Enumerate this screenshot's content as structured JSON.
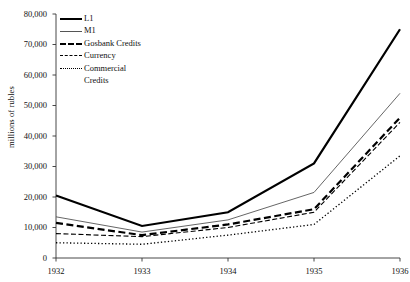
{
  "chart_data": {
    "type": "line",
    "title": "",
    "xlabel": "",
    "ylabel": "millions of rubles",
    "categories": [
      "1932",
      "1933",
      "1934",
      "1935",
      "1936"
    ],
    "x": [
      1932,
      1933,
      1934,
      1935,
      1936
    ],
    "xlim": [
      1932,
      1936
    ],
    "ylim": [
      0,
      80000
    ],
    "yticks": [
      0,
      10000,
      20000,
      30000,
      40000,
      50000,
      60000,
      70000,
      80000
    ],
    "ytick_labels": [
      "0",
      "10,000",
      "20,000",
      "30,000",
      "40,000",
      "50,000",
      "60,000",
      "70,000",
      "80,000"
    ],
    "xtick_labels": [
      "1932",
      "1933",
      "1934",
      "1935",
      "1936"
    ],
    "grid": false,
    "legend_position": "top-left",
    "series": [
      {
        "name": "L1",
        "style": "solid-thick",
        "values": [
          20500,
          10500,
          15000,
          31000,
          75000
        ]
      },
      {
        "name": "M1",
        "style": "solid-thin",
        "values": [
          13500,
          8500,
          12500,
          21500,
          54000
        ]
      },
      {
        "name": "Gosbank Credits",
        "style": "long-dash",
        "values": [
          11500,
          7500,
          11000,
          16000,
          46000
        ]
      },
      {
        "name": "Currency",
        "style": "short-dash",
        "values": [
          8000,
          7000,
          10000,
          15000,
          44500
        ]
      },
      {
        "name": "Commercial Credits",
        "style": "dotted",
        "values": [
          5000,
          4500,
          7500,
          11000,
          33500
        ]
      }
    ]
  },
  "legend": {
    "items": [
      {
        "label": "L1"
      },
      {
        "label": "M1"
      },
      {
        "label": "Gosbank Credits"
      },
      {
        "label": "Currency"
      },
      {
        "label": "Commercial\nCredits"
      }
    ]
  },
  "axes": {
    "y_title": "millions of rubles"
  },
  "colors": {
    "line_primary": "#000000",
    "line_secondary": "#555555",
    "axis": "#333333",
    "background": "#ffffff"
  }
}
